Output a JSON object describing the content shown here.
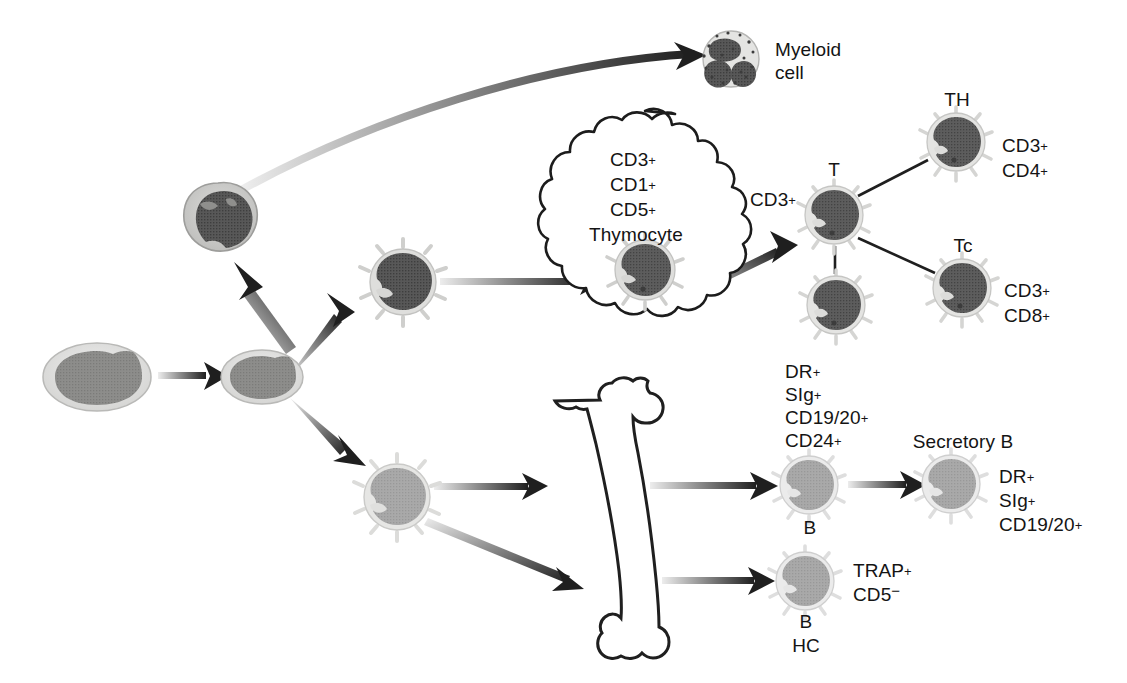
{
  "figure": {
    "type": "biological-lineage-diagram",
    "background_color": "#ffffff"
  },
  "palette": {
    "ink": "#141414",
    "arrow_dark": "#1f1f1f",
    "arrow_light": "#d8d8d8",
    "stem_cell_cytoplasm": "#d9d9d7",
    "stem_cell_nucleus": "#8a8a88",
    "myeloid_progenitor_cytoplasm": "#b5b5b3",
    "myeloid_progenitor_nucleus": "#4a4a4a",
    "myeloid_cell_cytoplasm": "#d2d2d0",
    "myeloid_cell_nucleus": "#4f4f4f",
    "t_cell_cytoplasm": "#e2e2e0",
    "t_cell_nucleus": "#5a5a5a",
    "b_cell_cytoplasm": "#dedede",
    "b_cell_nucleus": "#a0a0a0",
    "bone_outline": "#222222"
  },
  "labels": {
    "myeloid_cell": "Myeloid\ncell",
    "myeloid_cell_line1": "Myeloid",
    "myeloid_cell_line2": "cell",
    "thymus_markers": [
      "CD3",
      "CD1",
      "CD5"
    ],
    "thymocyte": "Thymocyte",
    "t_cell_marker_left": "CD3",
    "t_cell_name": "T",
    "th_name": "TH",
    "th_markers": [
      "CD3",
      "CD4"
    ],
    "tc_name": "Tc",
    "tc_markers": [
      "CD3",
      "CD8"
    ],
    "b_precursor_markers": [
      "DR",
      "SIg",
      "CD19/20",
      "CD24"
    ],
    "b_cell_name": "B",
    "secretory_b_name": "Secretory B",
    "secretory_b_markers": [
      "DR",
      "SIg",
      "CD19/20"
    ],
    "hairy_cell_markers": [
      "TRAP",
      "CD5"
    ],
    "hairy_cell_name_line1": "B",
    "hairy_cell_name_line2": "HC",
    "superscript_plus": "+",
    "superscript_minus": "−"
  },
  "marker_strings": {
    "thymus_cd3": "CD3",
    "thymus_cd1": "CD1",
    "thymus_cd5": "CD5",
    "t_cd3": "CD3",
    "th_cd3": "CD3",
    "th_cd4": "CD4",
    "tc_cd3": "CD3",
    "tc_cd8": "CD8",
    "b_dr": "DR",
    "b_sig": "SIg",
    "b_cd1920": "CD19/20",
    "b_cd24": "CD24",
    "sec_dr": "DR",
    "sec_sig": "SIg",
    "sec_cd1920": "CD19/20",
    "hc_trap": "TRAP",
    "hc_cd5": "CD5"
  },
  "nodes": [
    {
      "id": "stem-cell-1",
      "name": "hematopoietic-stem-cell",
      "kind": "oval-cell",
      "cx": 97,
      "cy": 377,
      "rx": 53,
      "ry": 33
    },
    {
      "id": "stem-cell-2",
      "name": "progenitor-stem-cell",
      "kind": "oval-cell",
      "cx": 262,
      "cy": 377,
      "rx": 40,
      "ry": 26
    },
    {
      "id": "myeloid-progenitor",
      "name": "myeloid-progenitor-cell",
      "kind": "lobed-cell",
      "cx": 218,
      "cy": 219,
      "r": 36
    },
    {
      "id": "myeloid-cell",
      "name": "myeloid-cell",
      "kind": "granular-cell",
      "cx": 731,
      "cy": 59,
      "r": 27
    },
    {
      "id": "lymphoid-progenitor-t",
      "name": "t-lymphoid-progenitor-cell",
      "kind": "spiky-cell-dark",
      "cx": 403,
      "cy": 282,
      "r": 31
    },
    {
      "id": "lymphoid-progenitor-b",
      "name": "b-lymphoid-progenitor-cell",
      "kind": "spiky-cell-light",
      "cx": 397,
      "cy": 497,
      "r": 31
    },
    {
      "id": "thymocyte",
      "name": "thymocyte-cell",
      "kind": "spiky-cell-dark",
      "cx": 645,
      "cy": 270,
      "r": 28
    },
    {
      "id": "t-cell-main",
      "name": "t-cell",
      "kind": "spiky-cell-dark",
      "cx": 834,
      "cy": 215,
      "r": 27
    },
    {
      "id": "t-cell-lower",
      "name": "t-cell-secondary",
      "kind": "spiky-cell-dark",
      "cx": 836,
      "cy": 305,
      "r": 27
    },
    {
      "id": "th-cell",
      "name": "t-helper-cell",
      "kind": "spiky-cell-dark",
      "cx": 956,
      "cy": 142,
      "r": 27
    },
    {
      "id": "tc-cell",
      "name": "t-cytotoxic-cell",
      "kind": "spiky-cell-dark",
      "cx": 962,
      "cy": 288,
      "r": 27
    },
    {
      "id": "b-cell",
      "name": "b-cell",
      "kind": "spiky-cell-light",
      "cx": 809,
      "cy": 485,
      "r": 27
    },
    {
      "id": "secretory-b-cell",
      "name": "secretory-b-cell",
      "kind": "spiky-cell-light",
      "cx": 951,
      "cy": 484,
      "r": 27
    },
    {
      "id": "hairy-cell",
      "name": "hairy-b-cell",
      "kind": "spiky-cell-light",
      "cx": 805,
      "cy": 581,
      "r": 27
    }
  ],
  "edges": [
    {
      "id": "e1",
      "name": "arrow-stem1-to-stem2",
      "style": "straight-gradient"
    },
    {
      "id": "e2",
      "name": "arrow-stem2-to-myeloid-progenitor",
      "style": "straight-gradient"
    },
    {
      "id": "e3",
      "name": "arrow-myeloid-progenitor-to-myeloid-cell",
      "style": "curved-gradient"
    },
    {
      "id": "e4",
      "name": "arrow-stem2-to-t-progenitor",
      "style": "straight-gradient"
    },
    {
      "id": "e5",
      "name": "arrow-stem2-to-b-progenitor",
      "style": "straight-gradient"
    },
    {
      "id": "e6",
      "name": "arrow-t-progenitor-to-thymocyte",
      "style": "straight-gradient"
    },
    {
      "id": "e7",
      "name": "arrow-thymocyte-to-t-cell",
      "style": "straight-gradient"
    },
    {
      "id": "e8",
      "name": "arrow-b-progenitor-to-bone-upper",
      "style": "straight-gradient"
    },
    {
      "id": "e9",
      "name": "arrow-b-progenitor-to-bone-lower",
      "style": "straight-gradient"
    },
    {
      "id": "e10",
      "name": "arrow-bone-to-b-cell",
      "style": "straight-gradient"
    },
    {
      "id": "e11",
      "name": "arrow-bone-to-hairy-cell",
      "style": "straight-gradient"
    },
    {
      "id": "e12",
      "name": "arrow-b-cell-to-secretory-b",
      "style": "straight-gradient"
    },
    {
      "id": "e13",
      "name": "connector-t-to-th",
      "style": "plain-line"
    },
    {
      "id": "e14",
      "name": "connector-t-to-tc",
      "style": "plain-line"
    },
    {
      "id": "e15",
      "name": "connector-t-to-t-lower",
      "style": "plain-line"
    }
  ],
  "organs": [
    {
      "id": "thymus",
      "name": "thymus-cloud-outline",
      "shape": "lobed-cloud"
    },
    {
      "id": "bone",
      "name": "bone-marrow-femur-outline",
      "shape": "femur"
    }
  ]
}
